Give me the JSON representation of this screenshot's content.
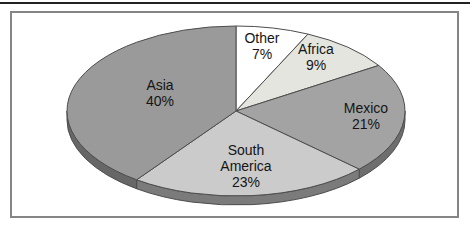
{
  "figure": {
    "top_rule_color": "#222222",
    "box_border_color": "#858585",
    "background": "#ffffff"
  },
  "chart_data": {
    "type": "pie",
    "title": "",
    "style": "3d-pie",
    "units": "%",
    "total": 100,
    "start_angle_deg": 90,
    "direction": "clockwise",
    "legend": "none",
    "labels_on_slices": true,
    "stroke_color": "#4d4d4d",
    "label_line_height": 16,
    "geometry": {
      "cx": 236,
      "cy": 111,
      "rx": 169,
      "ry": 85,
      "depth": 9
    },
    "categories": [
      "Other",
      "Africa",
      "Mexico",
      "South America",
      "Asia"
    ],
    "values": [
      7,
      9,
      21,
      23,
      40
    ],
    "slices": [
      {
        "id": "other",
        "label": "Other",
        "value": 7,
        "color": "#ffffff",
        "side_color": "#b0b0b0",
        "label_lines": [
          "Other",
          "7%"
        ],
        "label_x": 262,
        "label_y": 43
      },
      {
        "id": "africa",
        "label": "Africa",
        "value": 9,
        "color": "#e5e5e0",
        "side_color": "#a2a29e",
        "label_lines": [
          "Africa",
          "9%"
        ],
        "label_x": 316,
        "label_y": 54
      },
      {
        "id": "mexico",
        "label": "Mexico",
        "value": 21,
        "color": "#a3a3a3",
        "side_color": "#6e6e6e",
        "label_lines": [
          "Mexico",
          "21%"
        ],
        "label_x": 366,
        "label_y": 113
      },
      {
        "id": "south-america",
        "label": "South America",
        "value": 23,
        "color": "#cbcbcb",
        "side_color": "#7b7b7b",
        "label_lines": [
          "South",
          "America",
          "23%"
        ],
        "label_x": 246,
        "label_y": 155
      },
      {
        "id": "asia",
        "label": "Asia",
        "value": 40,
        "color": "#9a9a9a",
        "side_color": "#676767",
        "label_lines": [
          "Asia",
          "40%"
        ],
        "label_x": 160,
        "label_y": 90
      }
    ]
  }
}
